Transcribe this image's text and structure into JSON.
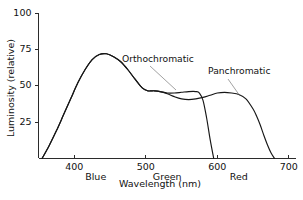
{
  "chart_data": {
    "type": "line",
    "title": "",
    "xlabel": "Wavelength (nm)",
    "ylabel": "Luminosity (relative)",
    "xlim": [
      350,
      710
    ],
    "ylim": [
      0,
      100
    ],
    "grid": false,
    "legend_position": "inline-annotations",
    "xticks": [
      400,
      500,
      600,
      700
    ],
    "xtick_labels": [
      "400",
      "500",
      "600",
      "700"
    ],
    "yticks": [
      25,
      50,
      75,
      100
    ],
    "ytick_labels": [
      "25",
      "50",
      "75",
      "100"
    ],
    "band_labels": [
      {
        "text": "Blue",
        "x": 430
      },
      {
        "text": "Green",
        "x": 530
      },
      {
        "text": "Red",
        "x": 630
      }
    ],
    "series": [
      {
        "name": "Orthochromatic",
        "label_x": 122,
        "label_y": 62,
        "leader": {
          "x1": 150,
          "y1": 66,
          "x2": 176,
          "y2": 90
        },
        "x": [
          355,
          365,
          375,
          385,
          395,
          405,
          415,
          425,
          435,
          445,
          455,
          465,
          475,
          485,
          495,
          503,
          508,
          512,
          520,
          530,
          540,
          550,
          560,
          570,
          575,
          580,
          585,
          590,
          595
        ],
        "y": [
          0,
          9,
          19,
          30,
          41,
          52,
          61,
          68,
          71.5,
          72,
          70,
          66.5,
          61,
          54.5,
          48.5,
          46.5,
          46.5,
          46.5,
          46,
          45,
          45,
          45.5,
          46,
          46,
          45,
          40,
          28,
          13,
          0
        ]
      },
      {
        "name": "Panchromatic",
        "label_x": 208,
        "label_y": 74,
        "leader": {
          "x1": 228,
          "y1": 79,
          "x2": 240,
          "y2": 96
        },
        "x": [
          355,
          365,
          375,
          385,
          395,
          405,
          415,
          425,
          435,
          445,
          455,
          465,
          475,
          485,
          495,
          503,
          508,
          512,
          520,
          530,
          540,
          550,
          560,
          570,
          580,
          590,
          600,
          610,
          620,
          630,
          640,
          650,
          655,
          660,
          665,
          670,
          675,
          680
        ],
        "y": [
          0,
          9,
          19,
          30,
          41,
          52,
          61,
          68,
          71.5,
          72,
          70,
          66.5,
          61,
          54.5,
          48.5,
          46.5,
          46.5,
          46.5,
          46,
          44.5,
          42.5,
          41,
          40.5,
          41,
          42,
          43.5,
          45,
          45.5,
          45,
          44,
          41,
          34,
          29,
          23,
          16,
          9.5,
          4,
          0
        ]
      }
    ]
  }
}
